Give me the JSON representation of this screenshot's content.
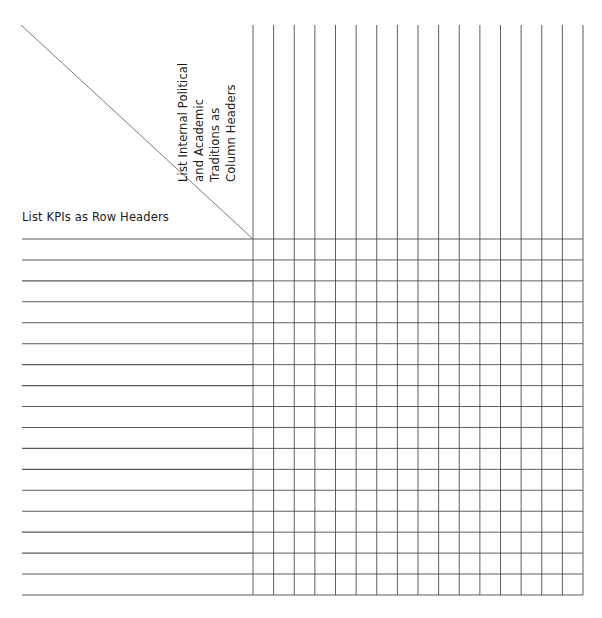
{
  "diagram": {
    "type": "matrix-worksheet",
    "title_cut_off": "",
    "row_header_instruction": "List KPIs as Row Headers",
    "column_header_instruction_lines": [
      "List Internal Political",
      "and Academic",
      "Traditions as",
      "Column Headers"
    ],
    "column_header_instruction": "List Internal Political and Academic Traditions as Column Headers",
    "geometry": {
      "row_label_area": {
        "x": 22,
        "y": 239,
        "width": 231,
        "height": 356
      },
      "grid_area": {
        "x": 253,
        "y": 25,
        "width": 330,
        "height": 570
      },
      "body_top_y": 239,
      "body_bottom_y": 595,
      "grid_left_x": 253,
      "grid_right_x": 583,
      "row_count": 17,
      "row_height": 20.94,
      "column_count": 16,
      "column_width": 20.625,
      "diagonal": {
        "x1": 21,
        "y1": 25,
        "x2": 253,
        "y2": 239
      }
    },
    "colors": {
      "background": "#ffffff",
      "rule_line": "#595959",
      "grid_line": "#4d4d4d",
      "diagonal_line": "#6b6b6b",
      "text": "#1b1b1b"
    },
    "stroke_widths": {
      "row_rule": 1.1,
      "grid_line": 0.9,
      "diagonal": 0.9
    }
  }
}
